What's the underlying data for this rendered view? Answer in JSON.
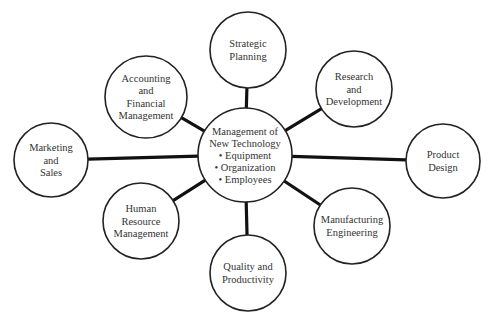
{
  "diagram": {
    "type": "hub-and-spoke",
    "center": {
      "id": "center",
      "cx": 245,
      "cy": 155,
      "r": 47,
      "lines": [
        "Management of",
        "New Technology",
        "• Equipment",
        "• Organization",
        "• Employees"
      ]
    },
    "nodes": [
      {
        "id": "strategic-planning",
        "cx": 248,
        "cy": 50,
        "r": 38,
        "lines": [
          "Strategic",
          "Planning"
        ]
      },
      {
        "id": "accounting-financial-management",
        "cx": 146,
        "cy": 97,
        "r": 41,
        "lines": [
          "Accounting",
          "and",
          "Financial",
          "Management"
        ]
      },
      {
        "id": "research-development",
        "cx": 354,
        "cy": 89,
        "r": 38,
        "lines": [
          "Research",
          "and",
          "Development"
        ]
      },
      {
        "id": "marketing-sales",
        "cx": 51,
        "cy": 160,
        "r": 37,
        "lines": [
          "Marketing",
          "and",
          "Sales"
        ]
      },
      {
        "id": "product-design",
        "cx": 443,
        "cy": 161,
        "r": 37,
        "lines": [
          "Product",
          "Design"
        ]
      },
      {
        "id": "human-resource-management",
        "cx": 141,
        "cy": 221,
        "r": 38,
        "lines": [
          "Human",
          "Resource",
          "Management"
        ]
      },
      {
        "id": "quality-productivity",
        "cx": 248,
        "cy": 273,
        "r": 38,
        "lines": [
          "Quality and",
          "Productivity"
        ]
      },
      {
        "id": "manufacturing-engineering",
        "cx": 352,
        "cy": 226,
        "r": 38,
        "lines": [
          "Manufacturing",
          "Engineering"
        ]
      }
    ],
    "style": {
      "circle_stroke": "#222222",
      "connector_stroke": "#111111",
      "text_color": "#333333",
      "background": "#ffffff"
    }
  }
}
